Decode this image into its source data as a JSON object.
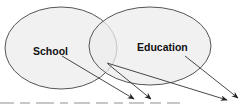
{
  "diagram": {
    "type": "venn-with-arrows",
    "colors": {
      "background": "#ffffff",
      "ellipse_fill": "#ececec",
      "ellipse_stroke": "#555555",
      "arrow": "#333333",
      "text": "#111111"
    },
    "sets": [
      {
        "label": "School",
        "cx": 61,
        "cy": 48,
        "rx": 56,
        "ry": 41,
        "label_x": 33,
        "label_y": 46
      },
      {
        "label": "Education",
        "cx": 150,
        "cy": 46,
        "rx": 61,
        "ry": 39,
        "label_x": 137,
        "label_y": 42
      }
    ],
    "arrows": [
      {
        "from": [
          62,
          56
        ],
        "to": [
          134,
          99
        ]
      },
      {
        "from": [
          108,
          64
        ],
        "to": [
          151,
          99
        ]
      },
      {
        "from": [
          107,
          63
        ],
        "to": [
          227,
          100
        ]
      },
      {
        "from": [
          185,
          56
        ],
        "to": [
          238,
          98
        ]
      }
    ]
  }
}
